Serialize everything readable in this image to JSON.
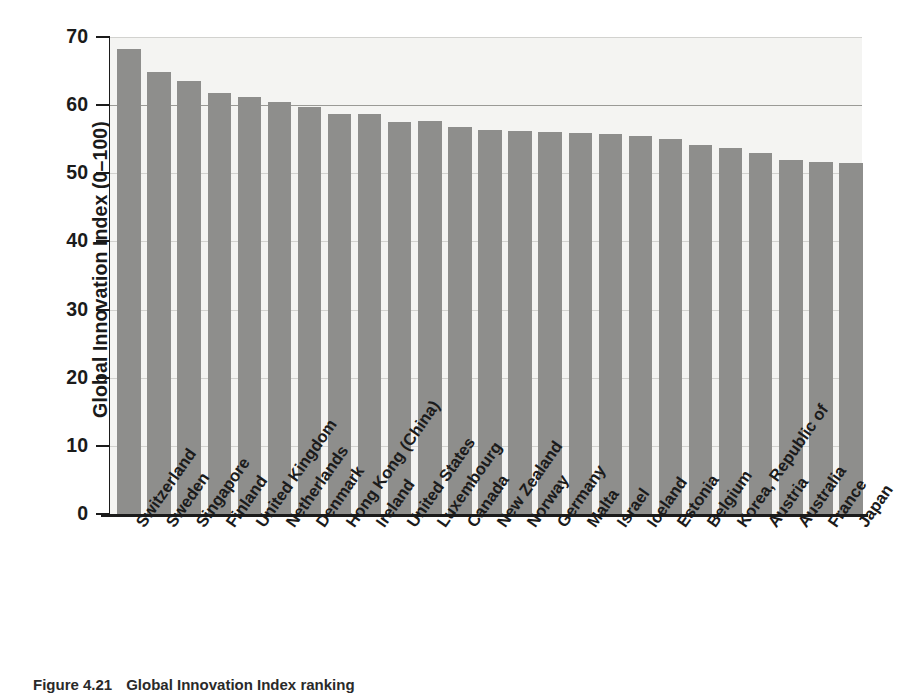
{
  "caption": {
    "figure_number": "Figure 4.21",
    "figure_title": "Global Innovation Index ranking"
  },
  "chart_data": {
    "type": "bar",
    "title": "",
    "xlabel": "",
    "ylabel": "Global Innovation Index (0–100)",
    "ylim": [
      0,
      70
    ],
    "yticks": [
      0,
      10,
      20,
      30,
      40,
      50,
      60,
      70
    ],
    "ytick_labels": [
      "0",
      "10",
      "20",
      "30",
      "40",
      "50",
      "60",
      "70"
    ],
    "grid": true,
    "legend": null,
    "bar_color": "#8e8e8c",
    "plot_background": "#f4f4f2",
    "categories": [
      "Switzerland",
      "Sweden",
      "Singapore",
      "Finland",
      "United Kingdom",
      "Netherlands",
      "Denmark",
      "Hong Kong (China)",
      "Ireland",
      "United States",
      "Luxembourg",
      "Canada",
      "New Zealand",
      "Norway",
      "Germany",
      "Malta",
      "Israel",
      "Iceland",
      "Estonia",
      "Belgium",
      "Korea, Republic of",
      "Austria",
      "Australia",
      "France",
      "Japan"
    ],
    "values": [
      68.2,
      64.8,
      63.5,
      61.8,
      61.2,
      60.5,
      59.8,
      58.7,
      58.7,
      57.6,
      57.7,
      56.8,
      56.4,
      56.2,
      56.0,
      55.9,
      55.7,
      55.5,
      55.0,
      54.1,
      53.7,
      53.0,
      51.9,
      51.7,
      51.5
    ]
  }
}
